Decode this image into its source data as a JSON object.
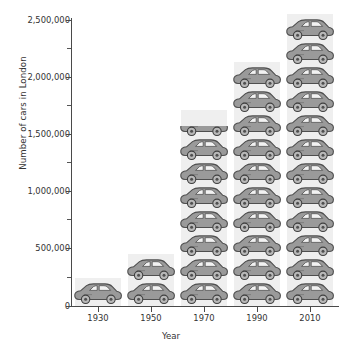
{
  "chart_data": {
    "type": "bar",
    "variant": "pictogram",
    "title": "",
    "xlabel": "Year",
    "ylabel": "Number of cars in London",
    "categories": [
      "1930",
      "1950",
      "1970",
      "1990",
      "2010"
    ],
    "values": [
      150000,
      400000,
      1425000,
      1900000,
      2280000
    ],
    "icon_counts": [
      1,
      2,
      7.5,
      10,
      12
    ],
    "icon_unit_value": 190000,
    "icon": "car-icon",
    "ylim": [
      0,
      2500000
    ],
    "xlim_labels": [
      "1930",
      "1950",
      "1970",
      "1990",
      "2010"
    ],
    "y_major_ticks": [
      0,
      500000,
      1000000,
      1500000,
      2000000,
      2500000
    ],
    "y_major_tick_labels": [
      "0",
      "500,000",
      "1,000,000",
      "1,500,000",
      "2,000,000",
      "2,500,000"
    ],
    "y_minor_tick_interval": 250000,
    "grid": false,
    "legend": "none",
    "colors": {
      "background": "#ffffff",
      "column_band": "#efefef",
      "icon_body": "#9a9a9a",
      "icon_outline": "#4f4f4f",
      "icon_window": "#f2f2f2",
      "axis": "#4a4a4a",
      "text": "#333333"
    }
  },
  "axes": {
    "y_title": "Number of cars in London",
    "x_title": "Year",
    "y_labels": [
      "2,500,000",
      "2,000,000",
      "1,500,000",
      "1,000,000",
      "500,000",
      "0"
    ],
    "x_labels": [
      "1930",
      "1950",
      "1970",
      "1990",
      "2010"
    ]
  }
}
